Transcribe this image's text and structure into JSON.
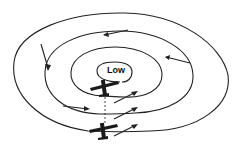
{
  "diagram": {
    "title": "",
    "center_label": "Low",
    "elements": {
      "isobars": [
        "outer-isobar",
        "second-isobar",
        "third-isobar",
        "inner-isobar"
      ],
      "wind_arrows": [
        "counterclockwise circulation arrows around low",
        "three parallel arrows pointing up-right (toward northeast)"
      ],
      "aircraft": [
        "upper airplane near low center",
        "lower airplane below, connected by dashed vertical line"
      ]
    },
    "colors": {
      "line": "#222222",
      "background": "#ffffff"
    }
  }
}
